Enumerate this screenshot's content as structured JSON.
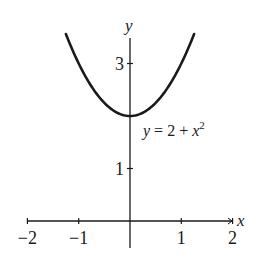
{
  "chart_data": {
    "type": "line",
    "title": "",
    "xlabel": "x",
    "ylabel": "y",
    "xlim": [
      -2,
      2
    ],
    "ylim": [
      0,
      3.5
    ],
    "grid": false,
    "legend": null,
    "x_ticks": [
      -2,
      -1,
      1,
      2
    ],
    "x_tick_labels": [
      "−2",
      "−1",
      "1",
      "2"
    ],
    "y_ticks": [
      1,
      3
    ],
    "y_tick_labels": [
      "1",
      "3"
    ],
    "series": [
      {
        "name": "y = 2 + x^2",
        "function": "2 + x^2",
        "x": [
          -1.25,
          -1.0,
          -0.75,
          -0.5,
          -0.25,
          0,
          0.25,
          0.5,
          0.75,
          1.0,
          1.25
        ],
        "values": [
          3.5625,
          3.0,
          2.5625,
          2.25,
          2.0625,
          2.0,
          2.0625,
          2.25,
          2.5625,
          3.0,
          3.5625
        ],
        "color": "#1a1a1a"
      }
    ],
    "annotations": [
      {
        "text_parts": [
          "y",
          " = 2 + ",
          "x",
          "2"
        ],
        "position": [
          0.35,
          2.2
        ]
      }
    ]
  },
  "labels": {
    "x_axis": "x",
    "y_axis": "y",
    "curve_label": {
      "lhs": "y",
      "mid": " = 2 + ",
      "var": "x",
      "exp": "2"
    }
  }
}
